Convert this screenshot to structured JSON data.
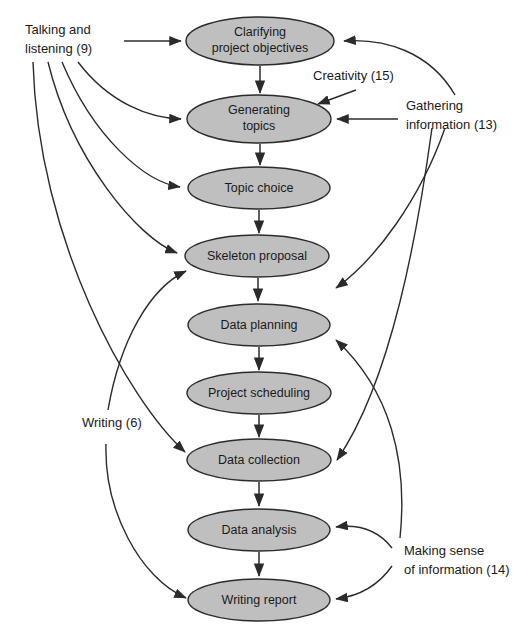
{
  "diagram": {
    "colors": {
      "node_fill": "#bfbfbf",
      "node_stroke": "#2b2b2b",
      "edge": "#2b2b2b",
      "text": "#1a1a1a",
      "background": "#ffffff"
    },
    "nodes": [
      {
        "id": "clarifying",
        "line1": "Clarifying",
        "line2": "project objectives",
        "cx": 260,
        "cy": 41,
        "rx": 74,
        "ry": 24
      },
      {
        "id": "generating",
        "line1": "Generating",
        "line2": "topics",
        "cx": 259,
        "cy": 119,
        "rx": 72,
        "ry": 24
      },
      {
        "id": "topic-choice",
        "line1": "Topic choice",
        "line2": "",
        "cx": 259,
        "cy": 188,
        "rx": 71,
        "ry": 21
      },
      {
        "id": "skeleton",
        "line1": "Skeleton proposal",
        "line2": "",
        "cx": 257,
        "cy": 256,
        "rx": 72,
        "ry": 21
      },
      {
        "id": "data-planning",
        "line1": "Data planning",
        "line2": "",
        "cx": 259,
        "cy": 325,
        "rx": 71,
        "ry": 21
      },
      {
        "id": "project-scheduling",
        "line1": "Project scheduling",
        "line2": "",
        "cx": 259,
        "cy": 393,
        "rx": 72,
        "ry": 21
      },
      {
        "id": "data-collection",
        "line1": "Data collection",
        "line2": "",
        "cx": 259,
        "cy": 460,
        "rx": 72,
        "ry": 21
      },
      {
        "id": "data-analysis",
        "line1": "Data analysis",
        "line2": "",
        "cx": 259,
        "cy": 530,
        "rx": 71,
        "ry": 21
      },
      {
        "id": "writing-report",
        "line1": "Writing report",
        "line2": "",
        "cx": 259,
        "cy": 600,
        "rx": 71,
        "ry": 21
      }
    ],
    "side_labels": [
      {
        "id": "talking",
        "line1": "Talking and",
        "line2": "listening (9)",
        "x": 25,
        "y": 34
      },
      {
        "id": "creativity",
        "line1": "Creativity (15)",
        "line2": "",
        "x": 313,
        "y": 80
      },
      {
        "id": "gathering",
        "line1": "Gathering",
        "line2": "information (13)",
        "x": 406,
        "y": 110
      },
      {
        "id": "writing",
        "line1": "Writing (6)",
        "line2": "",
        "x": 82,
        "y": 427
      },
      {
        "id": "making-sense",
        "line1": "Making sense",
        "line2": "of information (14)",
        "x": 404,
        "y": 555
      }
    ],
    "flow_edges": [
      {
        "from": "clarifying",
        "to": "generating"
      },
      {
        "from": "generating",
        "to": "topic-choice"
      },
      {
        "from": "topic-choice",
        "to": "skeleton"
      },
      {
        "from": "skeleton",
        "to": "data-planning"
      },
      {
        "from": "data-planning",
        "to": "project-scheduling"
      },
      {
        "from": "project-scheduling",
        "to": "data-collection"
      },
      {
        "from": "data-collection",
        "to": "data-analysis"
      },
      {
        "from": "data-analysis",
        "to": "writing-report"
      }
    ],
    "skill_edges": [
      {
        "from": "talking",
        "to": "clarifying"
      },
      {
        "from": "talking",
        "to": "generating"
      },
      {
        "from": "talking",
        "to": "topic-choice"
      },
      {
        "from": "talking",
        "to": "skeleton"
      },
      {
        "from": "talking",
        "to": "data-collection"
      },
      {
        "from": "creativity",
        "to": "generating"
      },
      {
        "from": "gathering",
        "to": "clarifying"
      },
      {
        "from": "gathering",
        "to": "generating"
      },
      {
        "from": "gathering",
        "to": "skeleton"
      },
      {
        "from": "gathering",
        "to": "data-collection"
      },
      {
        "from": "writing",
        "to": "skeleton"
      },
      {
        "from": "writing",
        "to": "writing-report"
      },
      {
        "from": "making-sense",
        "to": "data-planning"
      },
      {
        "from": "making-sense",
        "to": "data-analysis"
      },
      {
        "from": "making-sense",
        "to": "writing-report"
      }
    ]
  }
}
